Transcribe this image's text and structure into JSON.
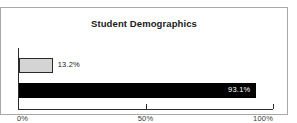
{
  "chart_data": {
    "type": "bar",
    "orientation": "horizontal",
    "title": "Student Demographics",
    "xlabel": "",
    "ylabel": "",
    "categories": [
      "",
      ""
    ],
    "values": [
      13.2,
      93.1
    ],
    "data_labels": [
      "13.2%",
      "93.1%"
    ],
    "xlim": [
      0,
      100
    ],
    "xticks": [
      0,
      50,
      100
    ],
    "xtick_labels": [
      "0%",
      "50%",
      "100%"
    ],
    "grid": false,
    "legend": false,
    "series": [
      {
        "name": "",
        "values": [
          13.2,
          93.1
        ]
      }
    ],
    "bar_colors": [
      "#d4d4d4",
      "#000000"
    ],
    "bar_border_colors": [
      "#2b2b2b",
      "#000000"
    ],
    "label_colors": [
      "#1a1a1a",
      "#ffffff"
    ]
  },
  "frame": {
    "border_color": "#a8a8a8",
    "background": "#ffffff"
  }
}
